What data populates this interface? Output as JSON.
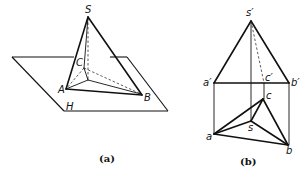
{
  "figure_a": {
    "caption": "(a)",
    "labels": {
      "apex": "S",
      "vertex_a": "A",
      "vertex_b": "B",
      "vertex_c": "C",
      "plane": "H"
    }
  },
  "figure_b": {
    "caption": "(b)",
    "labels": {
      "s_prime": "s′",
      "a_prime": "a′",
      "b_prime": "b′",
      "c_prime": "c′",
      "s": "s",
      "a": "a",
      "b": "b",
      "c": "c"
    }
  }
}
